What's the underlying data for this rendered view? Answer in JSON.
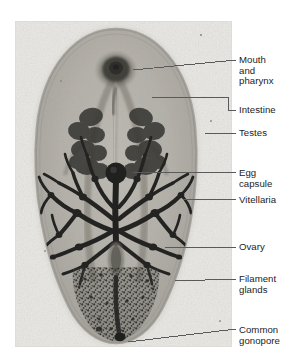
{
  "figure": {
    "type": "photomicrograph",
    "background_color": "#ffffff",
    "plate_color": "#e9e8e4",
    "label_color": "#1c1c1c",
    "leader_color": "#5a5a5a",
    "specimen_outline_color": "#8d8b86",
    "specimen_body_color": "#b9b6af",
    "organ_dark_color": "#161616"
  },
  "labels": [
    {
      "id": "mouth-and-pharynx",
      "text": "Mouth\nand\npharynx",
      "lines": [
        "Mouth",
        "and",
        "pharynx"
      ],
      "x": 239,
      "y": 55,
      "leader": {
        "type": "straight",
        "x1": 133,
        "y1": 70,
        "x2": 236,
        "y2": 60
      }
    },
    {
      "id": "intestine",
      "text": "Intestine",
      "lines": [
        "Intestine"
      ],
      "x": 239,
      "y": 105,
      "leader": {
        "type": "bracket",
        "x1": 152,
        "y1": 97,
        "x2": 228,
        "y2": 97,
        "x3": 228,
        "y3": 110,
        "x4": 236,
        "y4": 110
      }
    },
    {
      "id": "testes",
      "text": "Testes",
      "lines": [
        "Testes"
      ],
      "x": 239,
      "y": 128,
      "leader": {
        "type": "straight",
        "x1": 205,
        "y1": 133,
        "x2": 236,
        "y2": 133
      }
    },
    {
      "id": "egg-capsule",
      "text": "Egg\ncapsule",
      "lines": [
        "Egg",
        "capsule"
      ],
      "x": 239,
      "y": 168,
      "leader": {
        "type": "straight",
        "x1": 131,
        "y1": 172,
        "x2": 236,
        "y2": 173
      }
    },
    {
      "id": "vitellaria",
      "text": "Vitellaria",
      "lines": [
        "Vitellaria"
      ],
      "x": 239,
      "y": 195,
      "leader": {
        "type": "straight",
        "x1": 183,
        "y1": 199,
        "x2": 236,
        "y2": 199
      }
    },
    {
      "id": "ovary",
      "text": "Ovary",
      "lines": [
        "Ovary"
      ],
      "x": 239,
      "y": 242,
      "leader": {
        "type": "straight",
        "x1": 165,
        "y1": 247,
        "x2": 236,
        "y2": 247
      }
    },
    {
      "id": "filament-glands",
      "text": "Filament\nglands",
      "lines": [
        "Filament",
        "glands"
      ],
      "x": 239,
      "y": 274,
      "leader": {
        "type": "straight",
        "x1": 175,
        "y1": 281,
        "x2": 236,
        "y2": 279
      }
    },
    {
      "id": "common-gonopore",
      "text": "Common\ngonopore",
      "lines": [
        "Common",
        "gonopore"
      ],
      "x": 239,
      "y": 325,
      "leader": {
        "type": "straight",
        "x1": 128,
        "y1": 342,
        "x2": 236,
        "y2": 329
      }
    }
  ],
  "structures": [
    {
      "id": "mouth-and-pharynx",
      "label": "Mouth and pharynx",
      "region": "anterior midline"
    },
    {
      "id": "intestine",
      "label": "Intestine",
      "region": "paired anterior caeca"
    },
    {
      "id": "testes",
      "label": "Testes",
      "region": "paired mid-anterior lobed masses"
    },
    {
      "id": "egg-capsule",
      "label": "Egg capsule",
      "region": "mid-body center"
    },
    {
      "id": "vitellaria",
      "label": "Vitellaria",
      "region": "paired dendritic mid-body fields"
    },
    {
      "id": "ovary",
      "label": "Ovary",
      "region": "mid-posterior midline"
    },
    {
      "id": "filament-glands",
      "label": "Filament glands",
      "region": "posterior granular mass"
    },
    {
      "id": "common-gonopore",
      "label": "Common gonopore",
      "region": "posterior tip"
    }
  ]
}
